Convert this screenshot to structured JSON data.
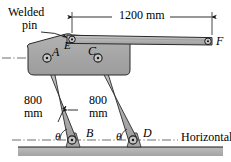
{
  "figure": {
    "kind": "mechanism-diagram",
    "background_color": "#ffffff",
    "body_fill": "#a8a8a8",
    "link_fill": "#b4b4b4",
    "ground_fill": "#b0b0b0",
    "line_color": "#1a1a1a",
    "centerline_color": "#555555"
  },
  "annotations": {
    "welded_line1": "Welded",
    "welded_line2": "pin",
    "dimension_ef": "1200 mm",
    "left_link_len_line1": "800",
    "left_link_len_line2": "mm",
    "right_link_len_line1": "800",
    "right_link_len_line2": "mm",
    "horizontal": "Horizontal",
    "theta_left": "θ",
    "theta_right": "θ"
  },
  "joints": {
    "a": "A",
    "b": "B",
    "c": "C",
    "d": "D",
    "e": "E",
    "f": "F"
  },
  "geometry": {
    "points": {
      "A": [
        47,
        58
      ],
      "B": [
        72,
        140
      ],
      "C": [
        98,
        58
      ],
      "D": [
        133,
        140
      ],
      "E": [
        72,
        39
      ],
      "F": [
        212,
        41
      ]
    },
    "dimension_line_y": 17,
    "ground_top_y": 147,
    "centerline_body_y": 58,
    "centerline_ground_y": 140
  }
}
